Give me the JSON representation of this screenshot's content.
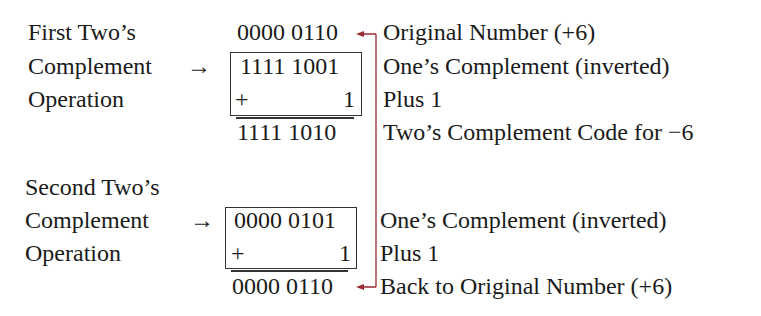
{
  "first_op": {
    "title_lines": [
      "First Two’s",
      "Complement",
      "Operation"
    ],
    "arrow": "→",
    "original": "0000 0110",
    "ones_complement": "1111 1001",
    "plus_sign": "+",
    "plus_value": "1",
    "result": "1111 1010",
    "notes": {
      "original": "Original Number (+6)",
      "ones": "One’s Complement (inverted)",
      "plus": "Plus 1",
      "result": "Two’s Complement Code for −6"
    }
  },
  "second_op": {
    "title_lines": [
      "Second Two’s",
      "Complement",
      "Operation"
    ],
    "arrow": "→",
    "ones_complement": "0000 0101",
    "plus_sign": "+",
    "plus_value": "1",
    "result": "0000 0110",
    "notes": {
      "ones": "One’s Complement (inverted)",
      "plus": "Plus 1",
      "result": "Back to Original Number (+6)"
    }
  },
  "colors": {
    "connector": "#9b2a35",
    "text": "#1a1a1a"
  }
}
